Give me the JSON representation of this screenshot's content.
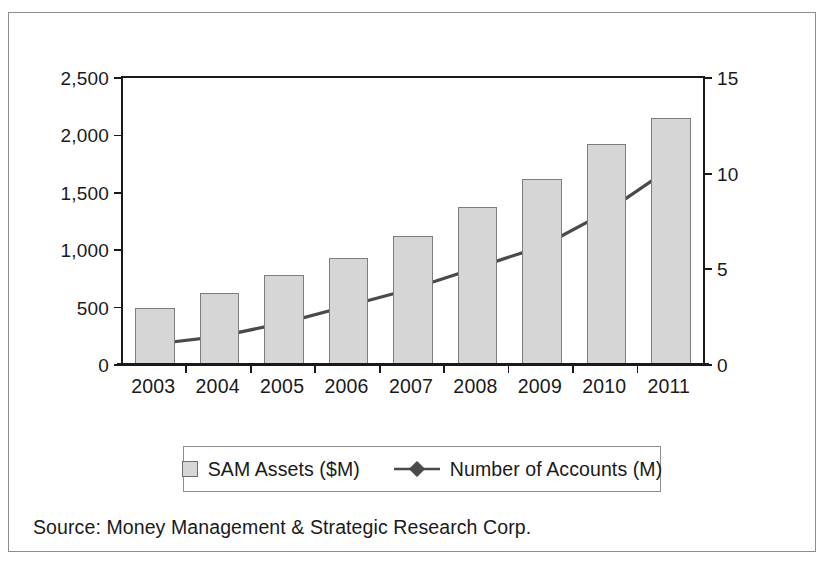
{
  "scan_artifact": {
    "text": "——————————————————"
  },
  "figure": {
    "source_note": "Source: Money Management & Strategic Research Corp.",
    "legend": [
      {
        "label": "SAM Assets ($M)",
        "marker": "square-swatch",
        "color": "#d6d6d6"
      },
      {
        "label": "Number of Accounts (M)",
        "marker": "diamond-line",
        "color": "#4a4a4a"
      }
    ]
  },
  "chart_data": {
    "type": "bar",
    "title": "",
    "subtitle": "",
    "xlabel": "",
    "ylabel": "",
    "y2label": "",
    "grid": false,
    "legend_position": "bottom",
    "categories": [
      "2003",
      "2004",
      "2005",
      "2006",
      "2007",
      "2008",
      "2009",
      "2010",
      "2011"
    ],
    "ylim": [
      0,
      2500
    ],
    "y2lim": [
      0,
      15
    ],
    "yticks": [
      "0",
      "500",
      "1,000",
      "1,500",
      "2,000",
      "2,500"
    ],
    "ytick_values": [
      0,
      500,
      1000,
      1500,
      2000,
      2500
    ],
    "y2ticks": [
      "0",
      "5",
      "10",
      "15"
    ],
    "y2tick_values": [
      0,
      5,
      10,
      15
    ],
    "series": [
      {
        "name": "SAM Assets ($M)",
        "type": "bar",
        "axis": "left",
        "color": "#d6d6d6",
        "edge_color": "#7d7d7d",
        "values": [
          500,
          630,
          780,
          930,
          1120,
          1380,
          1620,
          1925,
          2150
        ]
      },
      {
        "name": "Number of Accounts (M)",
        "type": "line",
        "axis": "right",
        "color": "#4a4a4a",
        "marker": "diamond",
        "values": [
          1.1,
          1.5,
          2.2,
          3.1,
          4.0,
          5.1,
          6.2,
          8.0,
          10.3
        ]
      }
    ]
  }
}
